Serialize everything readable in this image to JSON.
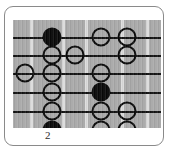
{
  "diagram": {
    "kind": "guitar-fretboard-scale-diagram",
    "fret_marker_label": "2",
    "colors": {
      "board": "#a8a8a8",
      "fret_line": "#dcdcdc",
      "string": "#111111",
      "note_outline": "#080808",
      "root_fill": "#080808",
      "card_border": "#8a8a8a",
      "background": "#ffffff"
    },
    "board": {
      "string_count": 6,
      "fret_count": 5,
      "string_y": [
        17,
        35,
        53,
        72,
        91,
        110
      ],
      "fret_x": [
        17,
        49,
        72,
        108,
        133
      ],
      "column_x": [
        12,
        39,
        62,
        88,
        114
      ]
    },
    "notes": [
      {
        "string": 1,
        "column": 1,
        "x": 39,
        "y": 17,
        "type": "root"
      },
      {
        "string": 1,
        "column": 3,
        "x": 88,
        "y": 17,
        "type": "open"
      },
      {
        "string": 1,
        "column": 4,
        "x": 114,
        "y": 17,
        "type": "open"
      },
      {
        "string": 2,
        "column": 1,
        "x": 39,
        "y": 35,
        "type": "open"
      },
      {
        "string": 2,
        "column": 2,
        "x": 62,
        "y": 35,
        "type": "open"
      },
      {
        "string": 2,
        "column": 4,
        "x": 114,
        "y": 35,
        "type": "open"
      },
      {
        "string": 3,
        "column": 0,
        "x": 12,
        "y": 53,
        "type": "open"
      },
      {
        "string": 3,
        "column": 1,
        "x": 39,
        "y": 53,
        "type": "open"
      },
      {
        "string": 3,
        "column": 3,
        "x": 88,
        "y": 53,
        "type": "open"
      },
      {
        "string": 4,
        "column": 1,
        "x": 39,
        "y": 72,
        "type": "open"
      },
      {
        "string": 4,
        "column": 3,
        "x": 88,
        "y": 72,
        "type": "root"
      },
      {
        "string": 5,
        "column": 1,
        "x": 39,
        "y": 91,
        "type": "open"
      },
      {
        "string": 5,
        "column": 3,
        "x": 88,
        "y": 91,
        "type": "open"
      },
      {
        "string": 5,
        "column": 4,
        "x": 114,
        "y": 91,
        "type": "open"
      },
      {
        "string": 6,
        "column": 1,
        "x": 39,
        "y": 110,
        "type": "root"
      },
      {
        "string": 6,
        "column": 3,
        "x": 88,
        "y": 110,
        "type": "open"
      },
      {
        "string": 6,
        "column": 4,
        "x": 114,
        "y": 110,
        "type": "open"
      }
    ]
  }
}
